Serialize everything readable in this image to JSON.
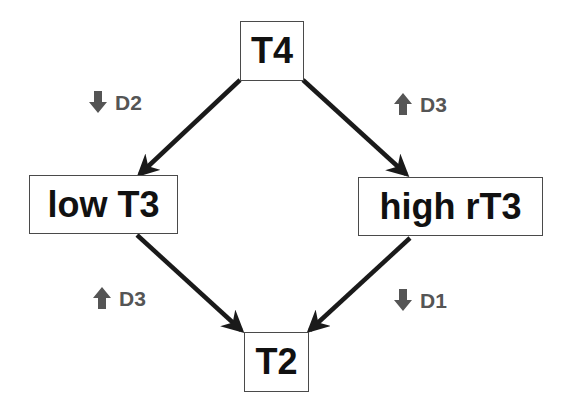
{
  "diagram": {
    "nodes": [
      {
        "id": "t4",
        "label": "T4"
      },
      {
        "id": "low-t3",
        "label": "low T3"
      },
      {
        "id": "high-rt3",
        "label": "high rT3"
      },
      {
        "id": "t2",
        "label": "T2"
      }
    ],
    "edges": [
      {
        "from": "T4",
        "to": "low T3",
        "label": "D2",
        "direction": "down",
        "icon": "down-arrow-icon"
      },
      {
        "from": "T4",
        "to": "high rT3",
        "label": "D3",
        "direction": "up",
        "icon": "up-arrow-icon"
      },
      {
        "from": "low T3",
        "to": "T2",
        "label": "D3",
        "direction": "up",
        "icon": "up-arrow-icon"
      },
      {
        "from": "high rT3",
        "to": "T2",
        "label": "D1",
        "direction": "down",
        "icon": "down-arrow-icon"
      }
    ],
    "colors": {
      "edge": "#1a1a1a",
      "label": "#555555",
      "node_border": "#4a4a4a",
      "node_text": "#111111"
    }
  }
}
